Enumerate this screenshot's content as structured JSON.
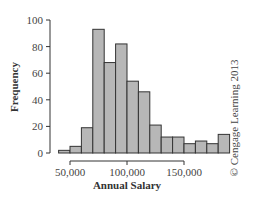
{
  "chart_data": {
    "type": "bar",
    "subtype": "histogram",
    "title": "",
    "xlabel": "Annual Salary",
    "ylabel": "Frequency",
    "ylim": [
      0,
      100
    ],
    "yticks": [
      0,
      20,
      40,
      60,
      80,
      100
    ],
    "xticks": [
      50000,
      100000,
      150000
    ],
    "xtick_labels": [
      "50,000",
      "100,000",
      "150,000"
    ],
    "bin_width": 10000,
    "bins": [
      {
        "start": 40000,
        "end": 50000,
        "value": 2
      },
      {
        "start": 50000,
        "end": 60000,
        "value": 5
      },
      {
        "start": 60000,
        "end": 70000,
        "value": 19
      },
      {
        "start": 70000,
        "end": 80000,
        "value": 93
      },
      {
        "start": 80000,
        "end": 90000,
        "value": 68
      },
      {
        "start": 90000,
        "end": 100000,
        "value": 82
      },
      {
        "start": 100000,
        "end": 110000,
        "value": 54
      },
      {
        "start": 110000,
        "end": 120000,
        "value": 46
      },
      {
        "start": 120000,
        "end": 130000,
        "value": 21
      },
      {
        "start": 130000,
        "end": 140000,
        "value": 12
      },
      {
        "start": 140000,
        "end": 150000,
        "value": 12
      },
      {
        "start": 150000,
        "end": 160000,
        "value": 7
      },
      {
        "start": 160000,
        "end": 170000,
        "value": 9
      },
      {
        "start": 170000,
        "end": 180000,
        "value": 7
      },
      {
        "start": 180000,
        "end": 190000,
        "value": 14
      }
    ],
    "grid": false,
    "legend": null
  },
  "labels": {
    "ylabel": "Frequency",
    "xlabel": "Annual Salary",
    "copyright": "© Cengage Learning 2013"
  },
  "colors": {
    "bar_fill": "#b7b7b7",
    "bar_stroke": "#333333",
    "axis": "#333333"
  }
}
